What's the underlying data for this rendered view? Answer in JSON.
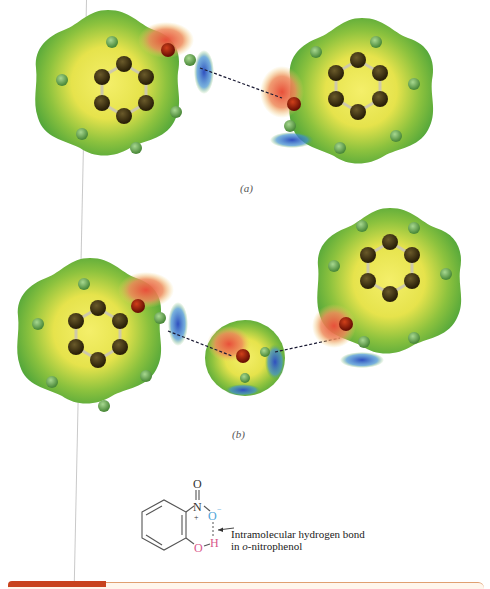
{
  "figure": {
    "panels": [
      {
        "label": "(a)",
        "description": "Phenol dimer electrostatic potential maps with intermolecular hydrogen bond"
      },
      {
        "label": "(b)",
        "description": "Two phenol molecules bridged by a water molecule via hydrogen bonds"
      }
    ],
    "colors": {
      "negative": "#e8503a",
      "neutral": "#5fb23a",
      "center": "#f2ec5a",
      "positive": "#2f4fbf",
      "carbon": "#3a2e12",
      "oxygen": "#9a1f0a",
      "hydrogen": "#6fae5a",
      "hbond": "#1a1a33"
    }
  },
  "structure": {
    "atoms": {
      "O_top": "O",
      "N": "N",
      "plus": "+",
      "O_minus": "O",
      "minus": "−",
      "O_bottom": "O",
      "H": "H"
    },
    "colors": {
      "bond": "#555555",
      "blue": "#4da3d8",
      "pink": "#d9588a"
    }
  },
  "annotation": {
    "line1": "Intramolecular hydrogen bond",
    "line2_prefix": "in ",
    "line2_italic": "o",
    "line2_suffix": "-nitrophenol"
  }
}
